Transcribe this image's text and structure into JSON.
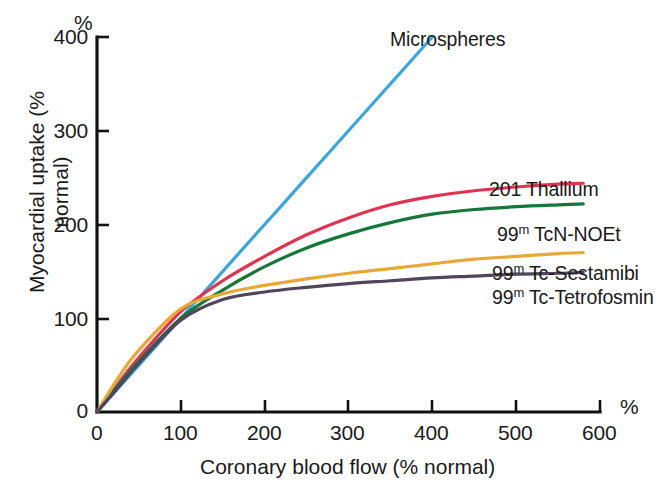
{
  "chart_data": {
    "type": "line",
    "title": "",
    "xlabel": "Coronary blood flow (% normal)",
    "ylabel": "Myocardial uptake (% normal)",
    "x_unit": "%",
    "y_unit": "%",
    "xlim": [
      0,
      600
    ],
    "ylim": [
      0,
      400
    ],
    "xticks": [
      "0",
      "100",
      "200",
      "300",
      "400",
      "500",
      "600"
    ],
    "yticks": [
      "0",
      "100",
      "200",
      "300",
      "400"
    ],
    "grid": false,
    "legend_position": "inline-end-of-curve",
    "series": [
      {
        "name": "Microspheres",
        "color": "#3BA6DE",
        "x": [
          0,
          50,
          100,
          150,
          200,
          250,
          300,
          350,
          400
        ],
        "values": [
          0,
          50,
          100,
          150,
          200,
          250,
          300,
          350,
          400
        ]
      },
      {
        "name": "201 Thallium",
        "color": "#E0334F",
        "x": [
          0,
          25,
          50,
          100,
          150,
          200,
          250,
          300,
          350,
          400,
          450,
          500,
          550,
          580
        ],
        "values": [
          0,
          30,
          58,
          107,
          140,
          166,
          189,
          207,
          221,
          230,
          236,
          240,
          243,
          244
        ]
      },
      {
        "name": "99m TcN-NOEt",
        "color": "#17763A",
        "x": [
          0,
          25,
          50,
          100,
          150,
          200,
          250,
          300,
          350,
          400,
          450,
          500,
          550,
          580
        ],
        "values": [
          0,
          28,
          54,
          100,
          130,
          155,
          175,
          190,
          202,
          211,
          216,
          219,
          221,
          222
        ]
      },
      {
        "name": "99m Tc-Sestamibi",
        "color": "#E8A838",
        "x": [
          0,
          25,
          50,
          100,
          150,
          200,
          250,
          300,
          350,
          400,
          450,
          500,
          550,
          580
        ],
        "values": [
          0,
          36,
          66,
          110,
          126,
          135,
          142,
          148,
          153,
          158,
          163,
          166,
          169,
          170
        ]
      },
      {
        "name": "99m Tc-Tetrofosmin",
        "color": "#50455C",
        "x": [
          0,
          25,
          50,
          100,
          150,
          200,
          250,
          300,
          350,
          400,
          450,
          500,
          550,
          580
        ],
        "values": [
          0,
          26,
          52,
          98,
          120,
          128,
          133,
          137,
          140,
          143,
          145,
          147,
          148,
          149
        ]
      }
    ],
    "annotations": [
      {
        "text": "Microspheres",
        "x": 305,
        "y": 395
      },
      {
        "text": "201 Thallium",
        "x": 500,
        "y": 255
      },
      {
        "text": "99m TcN-NOEt",
        "x": 510,
        "y": 200
      },
      {
        "text": "99m Tc-Sestamibi",
        "x": 505,
        "y": 152
      },
      {
        "text": "99m Tc-Tetrofosmin",
        "x": 505,
        "y": 128
      }
    ]
  },
  "labels": {
    "y_axis_title": "Myocardial uptake (% normal)",
    "x_axis_title": "Coronary blood flow (% normal)",
    "y_unit": "%",
    "x_unit": "%",
    "xticks": {
      "t0": "0",
      "t1": "100",
      "t2": "200",
      "t3": "300",
      "t4": "400",
      "t5": "500",
      "t6": "600"
    },
    "yticks": {
      "t0": "0",
      "t1": "100",
      "t2": "200",
      "t3": "300",
      "t4": "400"
    },
    "series": {
      "microspheres": "Microspheres",
      "thallium": "201 Thallium",
      "noet_iso": "99",
      "noet_sup": "m",
      "noet_rest": " TcN-NOEt",
      "sestamibi_iso": "99",
      "sestamibi_sup": "m",
      "sestamibi_rest": " Tc-Sestamibi",
      "tetrofosmin_iso": "99",
      "tetrofosmin_sup": "m",
      "tetrofosmin_rest": " Tc-Tetrofosmin"
    }
  }
}
